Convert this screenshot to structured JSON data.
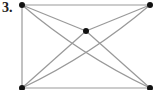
{
  "problem": {
    "number_label": "3."
  },
  "graph": {
    "vertices": [
      {
        "id": "TL",
        "x": 22,
        "y": 5
      },
      {
        "id": "TR",
        "x": 150,
        "y": 5
      },
      {
        "id": "C",
        "x": 86,
        "y": 31
      },
      {
        "id": "BL",
        "x": 22,
        "y": 88
      },
      {
        "id": "BR",
        "x": 150,
        "y": 88
      }
    ],
    "edges": [
      {
        "from": "TL",
        "to": "TR",
        "curved": false
      },
      {
        "from": "TL",
        "to": "BL",
        "curved": false
      },
      {
        "from": "BL",
        "to": "BR",
        "curved": false
      },
      {
        "from": "TL",
        "to": "C",
        "curved": false
      },
      {
        "from": "TR",
        "to": "C",
        "curved": false
      },
      {
        "from": "C",
        "to": "BL",
        "curved": false
      },
      {
        "from": "C",
        "to": "BR",
        "curved": false
      },
      {
        "from": "TL",
        "to": "BR",
        "curved": true
      },
      {
        "from": "TR",
        "to": "BL",
        "curved": true
      }
    ],
    "colors": {
      "edge": "#999999",
      "vertex": "#111111"
    }
  }
}
